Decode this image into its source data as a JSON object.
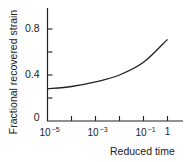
{
  "chart_data": {
    "type": "line",
    "title": "",
    "xlabel": "Reduced time",
    "ylabel": "Fractional recovered strain",
    "xscale": "log",
    "xlim": [
      1e-05,
      10
    ],
    "ylim": [
      0,
      1.0
    ],
    "x_ticks": [
      {
        "base": "10",
        "exp": "−5",
        "value": 1e-05
      },
      {
        "base": "10",
        "exp": "−3",
        "value": 0.001
      },
      {
        "base": "10",
        "exp": "−1",
        "value": 0.1
      },
      {
        "base": "1",
        "exp": "",
        "value": 1
      }
    ],
    "x_minor_ticks": [
      0.0001,
      0.01
    ],
    "y_ticks": [
      {
        "label": "0",
        "value": 0
      },
      {
        "label": "",
        "value": 0.2
      },
      {
        "label": "0.4",
        "value": 0.4
      },
      {
        "label": "",
        "value": 0.6
      },
      {
        "label": "0.8",
        "value": 0.8
      }
    ],
    "grid": false,
    "legend": null,
    "series": [
      {
        "name": "Fractional recovered strain",
        "x": [
          1e-05,
          0.0001,
          0.001,
          0.01,
          0.1,
          1
        ],
        "y": [
          0.28,
          0.3,
          0.34,
          0.4,
          0.51,
          0.71
        ]
      }
    ]
  }
}
